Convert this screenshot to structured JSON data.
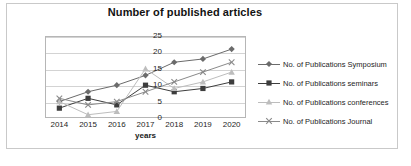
{
  "chart_data": {
    "type": "line",
    "title": "Number of published  articles",
    "xlabel": "years",
    "ylabel": "No. of publications",
    "categories": [
      "2014",
      "2015",
      "2016",
      "2017",
      "2018",
      "2019",
      "2020"
    ],
    "x": [
      2014,
      2015,
      2016,
      2017,
      2018,
      2019,
      2020
    ],
    "ylim": [
      0,
      25
    ],
    "yticks": [
      0,
      5,
      10,
      15,
      20,
      25
    ],
    "grid": true,
    "legend_position": "right",
    "series": [
      {
        "name": "No. of Publications Symposium",
        "marker": "diamond",
        "color": "#6b6b6b",
        "values": [
          5,
          8,
          10,
          13,
          17,
          18,
          21
        ]
      },
      {
        "name": "No. of Publications seminars",
        "marker": "square",
        "color": "#3d3d3d",
        "values": [
          3,
          6,
          4,
          10,
          8,
          9,
          11
        ]
      },
      {
        "name": "No. of Publications conferences",
        "marker": "triangle",
        "color": "#bdbdbd",
        "values": [
          5,
          1,
          2,
          15,
          9,
          11,
          14
        ]
      },
      {
        "name": "No. of Publications Journal",
        "marker": "cross",
        "color": "#8a8a8a",
        "values": [
          6,
          4,
          5,
          8,
          11,
          14,
          17
        ]
      }
    ]
  },
  "legend": {
    "items": [
      {
        "label": "No. of Publications Symposium"
      },
      {
        "label": "No. of Publications seminars"
      },
      {
        "label": "No. of Publications conferences"
      },
      {
        "label": "No. of Publications Journal"
      }
    ]
  },
  "caption": ""
}
